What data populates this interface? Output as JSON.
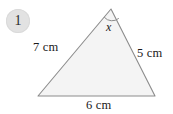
{
  "figure": {
    "badge": {
      "number": "1",
      "fill_color": "#e2e2e2",
      "text_color": "#2b2b2b"
    },
    "triangle": {
      "fill_color": "#f4f4f4",
      "stroke_color": "#8c8c8c",
      "vertices": {
        "apex": [
          111,
          9
        ],
        "bottom_left": [
          38,
          96
        ],
        "bottom_right": [
          155,
          96
        ]
      }
    },
    "angle": {
      "label": "x",
      "at_vertex": "apex",
      "arc_color": "#8c8c8c"
    },
    "sides": {
      "left_label": "7 cm",
      "right_label": "5 cm",
      "base_label": "6 cm"
    }
  },
  "chart_data": {
    "type": "diagram",
    "shape": "triangle",
    "labels": {
      "left_side": "7 cm",
      "right_side": "5 cm",
      "base": "6 cm",
      "angle": "x"
    },
    "values": {
      "left_side_cm": 7,
      "right_side_cm": 5,
      "base_cm": 6
    },
    "unknown": "x",
    "item_number": "1"
  }
}
